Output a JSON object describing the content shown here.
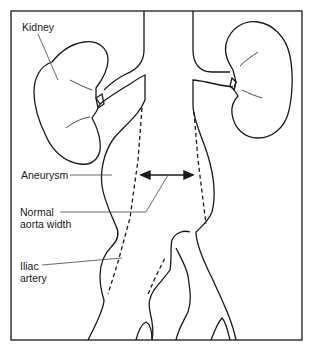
{
  "diagram": {
    "type": "anatomical illustration",
    "labels": {
      "kidney": "Kidney",
      "aneurysm": "Aneurysm",
      "normal_aorta_width_line1": "Normal",
      "normal_aorta_width_line2": "aorta width",
      "iliac_artery_line1": "Iliac",
      "iliac_artery_line2": "artery"
    },
    "colors": {
      "stroke": "#1a1a1a",
      "background": "#ffffff",
      "leader_line": "#444444"
    }
  }
}
